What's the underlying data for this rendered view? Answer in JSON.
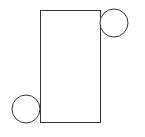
{
  "diagram": {
    "background": "#ffffff",
    "stroke": "#333333",
    "rectangle": {
      "x": 40,
      "y": 10,
      "width": 60,
      "height": 112
    },
    "circles": [
      {
        "name": "top-right",
        "cx": 114,
        "cy": 23,
        "r": 14
      },
      {
        "name": "bottom-left",
        "cx": 26,
        "cy": 109,
        "r": 14
      }
    ]
  }
}
